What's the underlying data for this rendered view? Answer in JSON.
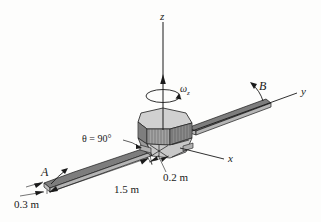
{
  "figure": {
    "background_color": "#fdfdfc",
    "line_color": "#1a1a1a",
    "panel_top_color": "#7d7d7d",
    "panel_side_color": "#b5b5b5",
    "body_top_color": "#d0d0d0",
    "body_side_color": "#9a9a9a",
    "body_shade_color": "#8a8a8a"
  },
  "axes": {
    "z_label": "z",
    "y_label": "y",
    "x_label": "x"
  },
  "rotation": {
    "symbol": "ω",
    "subscript": "z"
  },
  "points": {
    "a_label": "A",
    "b_label": "B"
  },
  "dimensions": {
    "length": "1.5 m",
    "width": "0.3 m",
    "body": "0.2 m",
    "angle": "θ = 90°"
  }
}
